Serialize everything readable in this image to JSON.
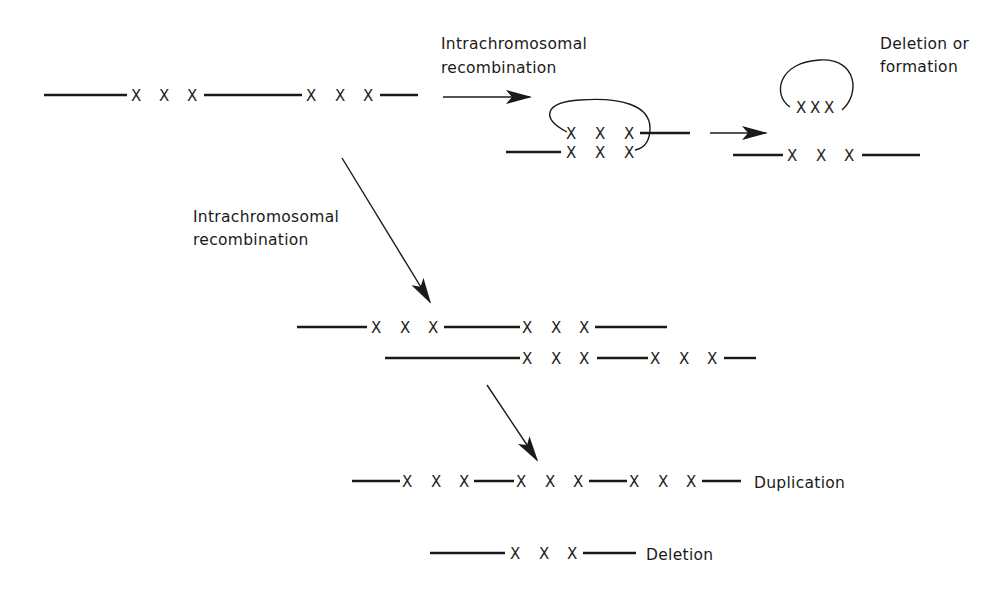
{
  "labels": {
    "top_arrow": [
      "Intrachromosomal",
      "recombination"
    ],
    "left_arrow": [
      "Intrachromosomal",
      "recombination"
    ],
    "circle_result": [
      "Deletion or",
      "formation"
    ],
    "duplication": "Duplication",
    "deletion": "Deletion"
  },
  "marker": "X",
  "colors": {
    "ink": "#1a1a1a",
    "background": "#ffffff"
  }
}
